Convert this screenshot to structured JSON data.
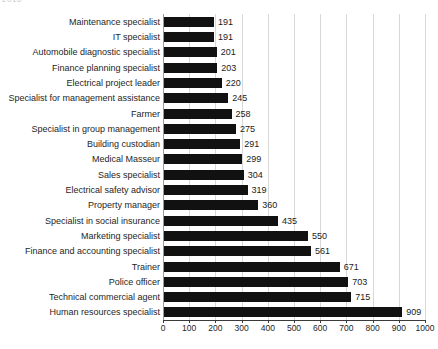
{
  "title_fragment": "2016",
  "chart_data": {
    "type": "bar",
    "orientation": "horizontal",
    "title": "",
    "subtitle": "",
    "xlabel": "",
    "ylabel": "",
    "xlim": [
      0,
      1000
    ],
    "xticks": [
      0,
      100,
      200,
      300,
      400,
      500,
      600,
      700,
      800,
      900,
      1000
    ],
    "grid": "vertical",
    "legend": "none",
    "bar_color": "#111111",
    "gridline_color": "#d8d8d8",
    "axis_color": "#3a3a3a",
    "categories": [
      "Maintenance specialist",
      "IT specialist",
      "Automobile diagnostic specialist",
      "Finance planning specialist",
      "Electrical project leader",
      "Specialist for management assistance",
      "Farmer",
      "Specialist in group management",
      "Building custodian",
      "Medical Masseur",
      "Sales specialist",
      "Electrical safety advisor",
      "Property manager",
      "Specialist in social insurance",
      "Marketing specialist",
      "Finance and accounting specialist",
      "Trainer",
      "Police officer",
      "Technical commercial agent",
      "Human resources specialist"
    ],
    "values": [
      191,
      191,
      201,
      203,
      220,
      245,
      258,
      275,
      291,
      299,
      304,
      319,
      360,
      435,
      550,
      561,
      671,
      703,
      715,
      909
    ]
  }
}
